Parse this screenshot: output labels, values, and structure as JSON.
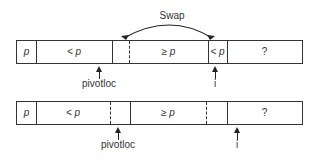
{
  "swap": {
    "label": "Swap"
  },
  "row1": {
    "cells": [
      {
        "text": "p"
      },
      {
        "text": "< p"
      },
      {
        "text": ""
      },
      {
        "text": "≥ p"
      },
      {
        "text": "< p"
      },
      {
        "text": "?"
      }
    ],
    "pointers": [
      {
        "label": "pivotloc"
      },
      {
        "label": "i"
      }
    ]
  },
  "row2": {
    "cells": [
      {
        "text": "p"
      },
      {
        "text": "< p"
      },
      {
        "text": ""
      },
      {
        "text": "≥ p"
      },
      {
        "text": ""
      },
      {
        "text": "?"
      }
    ],
    "pointers": [
      {
        "label": "pivotloc"
      },
      {
        "label": "i"
      }
    ]
  }
}
